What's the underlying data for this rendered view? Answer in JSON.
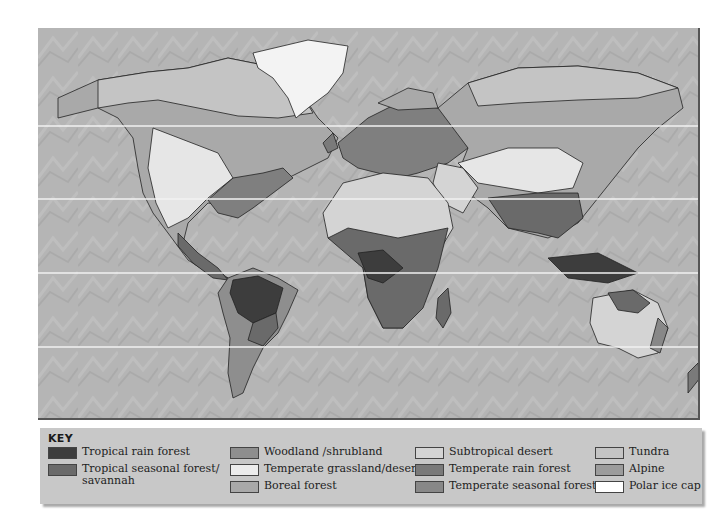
{
  "map": {
    "latitude_lines_y": [
      98,
      171,
      245,
      319
    ],
    "background_color": "#b3b3b3"
  },
  "key": {
    "title": "KEY",
    "columns": [
      [
        {
          "label": "Tropical rain forest",
          "color": "#3d3d3d"
        },
        {
          "label": "Tropical seasonal forest/",
          "label2": "savannah",
          "color": "#6a6a6a"
        }
      ],
      [
        {
          "label": "Woodland /shrubland",
          "color": "#8e8e8e"
        },
        {
          "label": "Temperate grassland/desert",
          "color": "#ececec"
        },
        {
          "label": "Boreal forest",
          "color": "#a9a9a9"
        }
      ],
      [
        {
          "label": "Subtropical desert",
          "color": "#d4d4d4"
        },
        {
          "label": "Temperate rain forest",
          "color": "#7a7a7a"
        },
        {
          "label": "Temperate seasonal forest",
          "color": "#888888"
        }
      ],
      [
        {
          "label": "Tundra",
          "color": "#c4c4c4"
        },
        {
          "label": "Alpine",
          "color": "#9c9c9c"
        },
        {
          "label": "Polar ice cap",
          "color": "#ffffff"
        }
      ]
    ]
  }
}
